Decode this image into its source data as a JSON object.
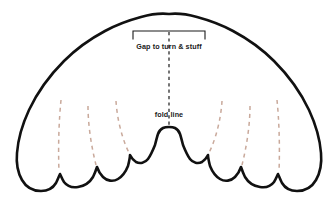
{
  "document": {
    "title": "Angel Wings Sewing Pattern",
    "background_color": "#ffffff"
  },
  "diagram": {
    "type": "sewing-pattern-template",
    "shape_name": "angel-wings",
    "outline": {
      "stroke_color": "#111111",
      "stroke_width": 2.6,
      "fill_color": "#ffffff"
    },
    "annotations": {
      "gap_label": "Gap to turn & stuff",
      "fold_label": "fold line"
    },
    "gap_bracket": {
      "name": "gap-bracket",
      "stroke_color": "#1a1a1a",
      "stroke_width": 1.1,
      "x_start": 133,
      "x_end": 205,
      "y_top": 31,
      "tick_length": 8
    },
    "fold_line": {
      "name": "fold-line",
      "stroke_color": "#1a1a1a",
      "stroke_width": 1.2,
      "dash": "3.2 3.2",
      "x": 169,
      "y_start": 32,
      "y_end": 127
    },
    "feather_lines": {
      "stroke_color": "#c9a99b",
      "stroke_width": 1.5,
      "dash": "4 4",
      "count": 6,
      "side_left_count": 3,
      "side_right_count": 3
    }
  }
}
